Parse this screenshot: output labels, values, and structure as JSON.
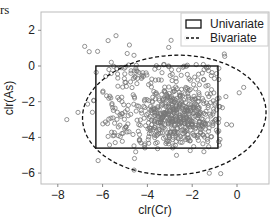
{
  "figure": {
    "corner_label": "rs"
  },
  "chart_data": {
    "type": "scatter",
    "title": "",
    "xlabel": "clr(Cr)",
    "ylabel": "clr(As)",
    "xlim": [
      -9.0,
      1.5
    ],
    "ylim": [
      -6.6,
      3.0
    ],
    "xticks": [
      -8,
      -6,
      -4,
      -2,
      0
    ],
    "yticks": [
      2,
      0,
      -2,
      -4,
      -6
    ],
    "xtick_labels": [
      "−8",
      "−6",
      "−4",
      "−2",
      "0"
    ],
    "ytick_labels": [
      "2",
      "0",
      "−2",
      "−4",
      "−6"
    ],
    "grid": false,
    "legend_position": "upper right",
    "legend": [
      {
        "label": "Univariate",
        "style": "solid-rectangle"
      },
      {
        "label": "Bivariate",
        "style": "dashed-line"
      }
    ],
    "univariate_box": {
      "x_min": -6.3,
      "x_max": -0.85,
      "y_min": -4.6,
      "y_max": 0.0
    },
    "bivariate_ellipse": {
      "cx": -2.8,
      "cy": -2.75,
      "rx": 4.1,
      "ry": 3.35,
      "angle_deg": -3
    },
    "points": {
      "count_approx": 700,
      "marker": "hollow-circle",
      "color": "#777777",
      "core_region": {
        "x": [
          -6.0,
          -1.0
        ],
        "y": [
          -4.5,
          0.0
        ]
      },
      "densest_center": {
        "x": -2.5,
        "y": -3.0
      },
      "sample_outliers": [
        {
          "x": -5.4,
          "y": 1.7
        },
        {
          "x": -6.8,
          "y": 1.1
        },
        {
          "x": -6.6,
          "y": 0.8
        },
        {
          "x": -4.9,
          "y": 0.7
        },
        {
          "x": -4.6,
          "y": 0.6
        },
        {
          "x": -7.1,
          "y": -2.6
        },
        {
          "x": -7.6,
          "y": -3.0
        },
        {
          "x": -6.2,
          "y": -5.3
        },
        {
          "x": -2.7,
          "y": -5.0
        },
        {
          "x": 0.1,
          "y": -1.5
        },
        {
          "x": 0.3,
          "y": -1.2
        },
        {
          "x": -0.8,
          "y": -1.8
        }
      ]
    }
  }
}
